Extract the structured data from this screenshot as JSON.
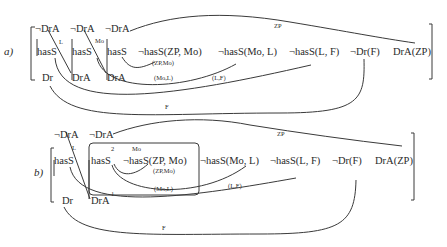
{
  "panel_a": {
    "label": "a)",
    "row1": [
      "¬DrA",
      "¬DrA",
      "¬DrA"
    ],
    "row2": [
      "hasS",
      "hasS",
      "hasS",
      "¬hasS(ZP, Mo)",
      "¬hasS(Mo, L)",
      "¬hasS(L, F)",
      "¬Dr(F)",
      "DrA(ZP)"
    ],
    "row3": [
      "Dr",
      "DrA",
      "DrA"
    ],
    "edge_labels": {
      "l": "L",
      "mo": "Mo",
      "zpmo": "(ZP,Mo)",
      "mol": "(Mo,L)",
      "lf": "(L,F)",
      "f": "F",
      "zp": "ZP"
    }
  },
  "panel_b": {
    "label": "b)",
    "row1": [
      "¬DrA",
      "¬DrA"
    ],
    "row2": [
      "hasS",
      "hasS",
      "¬hasS(ZP, Mo)",
      "¬hasS(Mo, L)",
      "¬hasS(L, F)",
      "¬Dr(F)",
      "DrA(ZP)"
    ],
    "row3": [
      "Dr",
      "DrA"
    ],
    "edge_labels": {
      "l": "L",
      "mo": "Mo",
      "zpmo": "(ZP,Mo)",
      "mol": "(Mo,L)",
      "lf": "(L,F)",
      "f": "F",
      "zp": "ZP",
      "box1": "1",
      "box2": "2"
    }
  }
}
